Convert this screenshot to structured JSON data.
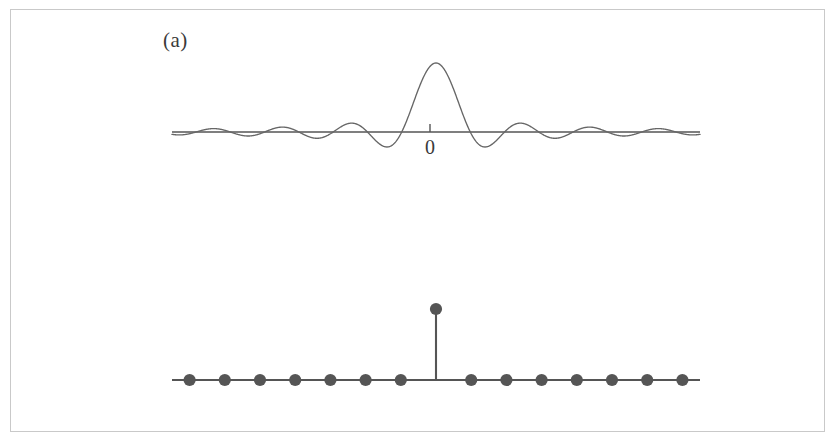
{
  "figure": {
    "background_color": "#ffffff",
    "border_color": "#c9c9c9",
    "curve_color": "#666666",
    "axis_color": "#555555",
    "marker_color": "#555555",
    "text_color": "#3a3a3a"
  },
  "panels": [
    {
      "label": "(a)",
      "origin_tick_label": "0",
      "caption_role": "continuous-sinc-function"
    },
    {
      "label": "(b)",
      "origin_tick_label": "0",
      "caption_role": "discrete-impulse-sequence"
    }
  ],
  "chart_data": [
    {
      "type": "line",
      "title": "",
      "subtitle": "",
      "xlabel": "",
      "ylabel": "",
      "series_name": "sinc",
      "function": "sin(pi*x)/(pi*x)",
      "xlim": [
        -7.7,
        7.7
      ],
      "ylim": [
        -0.25,
        1.05
      ],
      "grid": false,
      "legend": false,
      "axis": {
        "zero_tick_label": "0",
        "zero_tick_value": 0,
        "baseline_y_value": 0,
        "x_axis_drawn": true,
        "y_axis_drawn": false
      },
      "annotations": [
        "0"
      ],
      "x": [
        -7.5,
        -7.0,
        -6.5,
        -6.0,
        -5.5,
        -5.0,
        -4.5,
        -4.0,
        -3.5,
        -3.0,
        -2.5,
        -2.0,
        -1.5,
        -1.0,
        -0.5,
        0.0,
        0.5,
        1.0,
        1.5,
        2.0,
        2.5,
        3.0,
        3.5,
        4.0,
        4.5,
        5.0,
        5.5,
        6.0,
        6.5,
        7.0,
        7.5
      ],
      "values": [
        0.042,
        0.0,
        -0.049,
        0.0,
        0.058,
        0.0,
        -0.071,
        0.0,
        0.091,
        0.0,
        -0.127,
        0.0,
        0.212,
        0.0,
        0.637,
        1.0,
        0.637,
        0.0,
        -0.212,
        0.0,
        0.127,
        0.0,
        -0.091,
        0.0,
        0.071,
        0.0,
        -0.058,
        0.0,
        0.049,
        0.0,
        -0.042
      ]
    },
    {
      "type": "scatter",
      "title": "",
      "subtitle": "",
      "xlabel": "",
      "ylabel": "",
      "series_name": "discrete impulse",
      "function": "delta[n]",
      "xlim": [
        -7.5,
        7.5
      ],
      "ylim": [
        -0.1,
        1.1
      ],
      "grid": false,
      "legend": false,
      "marker": "filled-circle",
      "stems": true,
      "axis": {
        "zero_tick_label": "0",
        "zero_tick_value": 0,
        "baseline_y_value": 0,
        "x_axis_drawn": true,
        "y_axis_drawn": false
      },
      "annotations": [
        "0"
      ],
      "x": [
        -7,
        -6,
        -5,
        -4,
        -3,
        -2,
        -1,
        0,
        1,
        2,
        3,
        4,
        5,
        6,
        7
      ],
      "values": [
        0,
        0,
        0,
        0,
        0,
        0,
        0,
        1,
        0,
        0,
        0,
        0,
        0,
        0,
        0
      ]
    }
  ]
}
